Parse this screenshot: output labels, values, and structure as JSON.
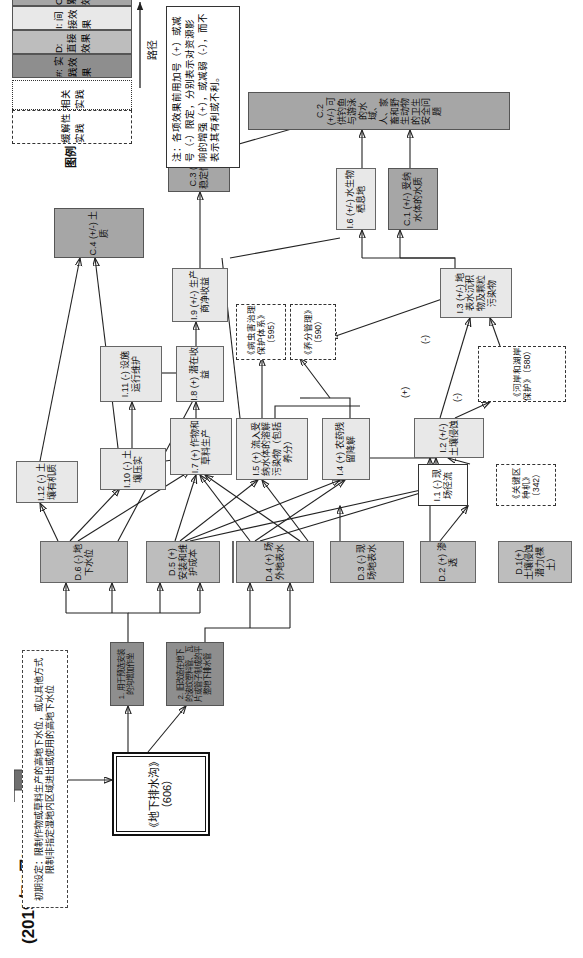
{
  "header": {
    "date_title": "(2019年5月)"
  },
  "start": {
    "arrow_label": "开始",
    "initial_setting": "初期设定：限制作物或草料生产的高地下水位，或以其他方式限制非指定湿地内区域进出或使用的高地下水位"
  },
  "practice": {
    "main_box": "《地下排水沟》（606）",
    "desc_1": "1. 用于预选安装的沟增加作坐",
    "desc_2": "2. 旧改造在地下的波纹塑料管、瓦片或管子制成的平整地下排水管"
  },
  "legend": {
    "title": "图例",
    "mitigating_practice": "缓解性实践",
    "related_practice": "相关实践",
    "rows": [
      {
        "code": "#",
        "label": "#: 实践效果",
        "fill": "#8e8e8e"
      },
      {
        "code": "D",
        "label": "D: 直接效果",
        "fill": "#bdbdbd"
      },
      {
        "code": "I",
        "label": "I: 间接效果",
        "fill": "#e8e8e8"
      },
      {
        "code": "C",
        "label": "C: 累积效果",
        "fill": "#a6a6a6"
      }
    ],
    "path_label": "路径",
    "note": "注：各项效果前用加号（+）或减号（-）限定，分别表示对资源影响的增强（+），或减弱（-），而不表示其有利或不利。"
  },
  "nodes": {
    "d1": "D.1(+) 土壤侵蚀潜力(裸土）",
    "d2": "D.2 (+) 渗透",
    "d3": "D.3 (-) 现场地表水",
    "d4": "D.4 (+) 场外地表水",
    "d5": "D.5 (+) 安装和维护成本",
    "d6": "D.6 (-) 地下水位",
    "i1": "I.1 (-) 现场径流",
    "i2": "I.2 (+/-) 土壤侵蚀",
    "i3": "I.3 (+/-) 地表水沉积物及颗粒污染物",
    "i4": "I.4 (+) 农药残留降解",
    "i5": "I.5 (+) 流入受纳水体的溶解污染物（包括养分）",
    "i6": "I.6 (+/-) 水生物栖息地",
    "i7": "I.7 (+) 作物和草料生产",
    "i8": "I.8 (+) 潜在收益",
    "i9": "I.9 (+/-) 生产商净收益",
    "i10": "I.10 (-) 土壤压实",
    "i11": "I.11 (-) 设施运行维护",
    "i12": "I.12 (-) 土壤有机质",
    "c1": "C.1 (+/-) 受纳水体的水质",
    "c2": "C.2 (+/-) 可供钓鱼与游泳的水域、人、家畜和野生动物的卫生安全问题",
    "c3": "C.3 (+/-) 收入和收入稳定性（个人和群体）",
    "c4": "C.4 (+/-) 土质"
  },
  "related_practices": {
    "p342": "《关键区种机》（342）",
    "p580": "《河岸和湖岸保护》（580）",
    "p590": "《养分管理》（590）",
    "p595": "《病虫害治理保护体系》（595）"
  },
  "edge_labels": {
    "plus_1": "(+)",
    "minus_1": "(-)",
    "minus_2": "(-)"
  }
}
